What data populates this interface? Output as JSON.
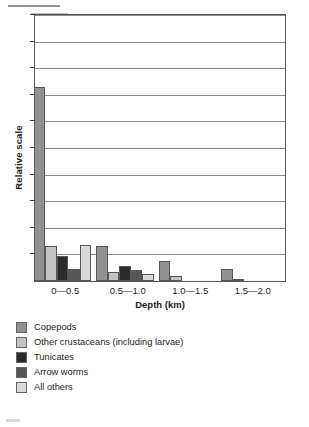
{
  "figure": {
    "y_axis_title": "Relative scale",
    "x_axis_title": "Depth (km)"
  },
  "legend": {
    "items": [
      {
        "label": "Copepods",
        "color": "#919191"
      },
      {
        "label": "Other crustaceans (including larvae)",
        "color": "#c3c3c3"
      },
      {
        "label": "Tunicates",
        "color": "#2b2b2b"
      },
      {
        "label": "Arrow worms",
        "color": "#565656"
      },
      {
        "label": "All others",
        "color": "#d8d8d8"
      }
    ]
  },
  "chart_data": {
    "type": "bar",
    "title": "",
    "subtitle": "",
    "xlabel": "Depth (km)",
    "ylabel": "Relative scale",
    "categories": [
      "0—0.5",
      "0.5—1.0",
      "1.0—1.5",
      "1.5—2.0"
    ],
    "series": [
      {
        "name": "Copepods",
        "color": "#919191",
        "values": [
          7.3,
          1.3,
          0.75,
          0.45
        ]
      },
      {
        "name": "Other crustaceans (including larvae)",
        "color": "#c3c3c3",
        "values": [
          1.3,
          0.35,
          0.2,
          0.05
        ]
      },
      {
        "name": "Tunicates",
        "color": "#2b2b2b",
        "values": [
          0.95,
          0.55,
          0.0,
          0.0
        ]
      },
      {
        "name": "Arrow worms",
        "color": "#565656",
        "values": [
          0.45,
          0.4,
          0.0,
          0.0
        ]
      },
      {
        "name": "All others",
        "color": "#d8d8d8",
        "values": [
          1.35,
          0.25,
          0.0,
          0.0
        ]
      }
    ],
    "ylim": [
      0,
      10
    ],
    "yticks": [
      1,
      2,
      3,
      4,
      5,
      6,
      7,
      8,
      9,
      10
    ],
    "ytick_labels": [],
    "grid": true,
    "grid_axis": "y",
    "legend_position": "below-plot"
  }
}
